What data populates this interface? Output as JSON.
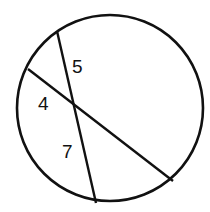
{
  "diagram": {
    "type": "circle-with-intersecting-chords",
    "stroke_color": "#111111",
    "background": "#ffffff",
    "circle": {
      "cx": 110,
      "cy": 108,
      "r": 93
    },
    "chords": [
      {
        "name": "steep-chord",
        "x1": 57,
        "y1": 31,
        "x2": 96,
        "y2": 203
      },
      {
        "name": "diagonal-chord",
        "x1": 28,
        "y1": 69,
        "x2": 173,
        "y2": 181
      }
    ],
    "intersection": {
      "x": 72,
      "y": 104
    },
    "labels": [
      {
        "text": "5",
        "x": 72,
        "y": 73
      },
      {
        "text": "4",
        "x": 38,
        "y": 110
      },
      {
        "text": "7",
        "x": 62,
        "y": 158
      }
    ]
  }
}
